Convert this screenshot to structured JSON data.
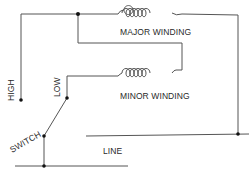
{
  "diagram": {
    "type": "wiring-schematic",
    "labels": {
      "major_winding": "MAJOR WINDING",
      "minor_winding": "MINOR WINDING",
      "high": "HIGH",
      "low": "LOW",
      "switch": "SWITCH",
      "line": "LINE"
    },
    "colors": {
      "wire": "#555555",
      "dot": "#111111",
      "text": "#2a2a2a",
      "background": "#ffffff"
    },
    "components": [
      {
        "id": "major-winding",
        "kind": "coil",
        "turns": 6
      },
      {
        "id": "minor-winding",
        "kind": "coil",
        "turns": 6
      },
      {
        "id": "switch",
        "kind": "two-position-switch",
        "positions": [
          "HIGH",
          "LOW"
        ]
      }
    ]
  }
}
